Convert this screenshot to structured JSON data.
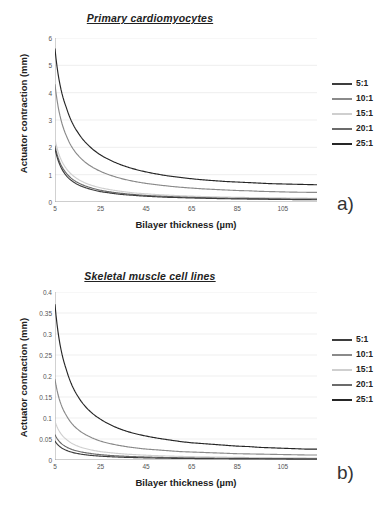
{
  "figure": {
    "panels": [
      {
        "key": "a",
        "panel_label": "a)",
        "title": "Primary cardiomyocytes",
        "xlabel": "Bilayer thickness  (µm)",
        "ylabel": "Actuator contraction  (mm)"
      },
      {
        "key": "b",
        "panel_label": "b)",
        "title": "Skeletal muscle cell lines",
        "xlabel": "Bilayer thickness  (µm)",
        "ylabel": "Actuator contraction  (mm)"
      }
    ],
    "legend": {
      "entries": [
        {
          "label": "5:1",
          "color": "#3d3d3d"
        },
        {
          "label": "10:1",
          "color": "#8a8a8a"
        },
        {
          "label": "15:1",
          "color": "#cfcfcf"
        },
        {
          "label": "20:1",
          "color": "#6b6b6b"
        },
        {
          "label": "25:1",
          "color": "#262626"
        }
      ]
    }
  },
  "chart_data": [
    {
      "type": "line",
      "panel": "a",
      "title": "Primary cardiomyocytes",
      "xlabel": "Bilayer thickness  (µm)",
      "ylabel": "Actuator contraction  (mm)",
      "xlim": [
        5,
        120
      ],
      "ylim": [
        0,
        6
      ],
      "xticks": [
        5,
        25,
        45,
        65,
        85,
        105
      ],
      "yticks": [
        0,
        1,
        2,
        3,
        4,
        5,
        6
      ],
      "xticklabels": [
        "5",
        "25",
        "45",
        "65",
        "85",
        "105"
      ],
      "yticklabels": [
        "0",
        "1",
        "2",
        "3",
        "4",
        "5",
        "6"
      ],
      "grid": "horizontal",
      "legend_position": "right-outside",
      "x": [
        5,
        10,
        15,
        20,
        25,
        30,
        35,
        40,
        45,
        50,
        55,
        60,
        65,
        70,
        75,
        80,
        85,
        90,
        95,
        100,
        105,
        110,
        115,
        120
      ],
      "series": [
        {
          "name": "25:1",
          "color": "#262626",
          "values": [
            5.6,
            3.45,
            2.55,
            2.05,
            1.72,
            1.5,
            1.33,
            1.2,
            1.1,
            1.02,
            0.95,
            0.9,
            0.85,
            0.81,
            0.78,
            0.75,
            0.73,
            0.71,
            0.69,
            0.67,
            0.66,
            0.65,
            0.64,
            0.63
          ]
        },
        {
          "name": "10:1",
          "color": "#8a8a8a",
          "values": [
            4.3,
            2.42,
            1.72,
            1.35,
            1.12,
            0.96,
            0.84,
            0.75,
            0.68,
            0.63,
            0.58,
            0.54,
            0.51,
            0.48,
            0.46,
            0.44,
            0.42,
            0.41,
            0.39,
            0.38,
            0.37,
            0.36,
            0.355,
            0.35
          ]
        },
        {
          "name": "15:1",
          "color": "#cfcfcf",
          "values": [
            2.3,
            1.22,
            0.84,
            0.64,
            0.52,
            0.44,
            0.38,
            0.33,
            0.3,
            0.27,
            0.25,
            0.23,
            0.215,
            0.2,
            0.19,
            0.18,
            0.17,
            0.165,
            0.16,
            0.155,
            0.15,
            0.145,
            0.14,
            0.135
          ]
        },
        {
          "name": "20:1",
          "color": "#6b6b6b",
          "values": [
            2.05,
            1.05,
            0.71,
            0.54,
            0.43,
            0.36,
            0.31,
            0.27,
            0.24,
            0.22,
            0.2,
            0.185,
            0.17,
            0.16,
            0.15,
            0.14,
            0.135,
            0.13,
            0.125,
            0.12,
            0.115,
            0.11,
            0.108,
            0.105
          ]
        },
        {
          "name": "5:1",
          "color": "#3d3d3d",
          "values": [
            1.95,
            0.96,
            0.64,
            0.48,
            0.38,
            0.32,
            0.27,
            0.24,
            0.21,
            0.19,
            0.17,
            0.16,
            0.147,
            0.137,
            0.128,
            0.12,
            0.113,
            0.107,
            0.102,
            0.097,
            0.093,
            0.089,
            0.086,
            0.083
          ]
        }
      ]
    },
    {
      "type": "line",
      "panel": "b",
      "title": "Skeletal muscle cell lines",
      "xlabel": "Bilayer thickness  (µm)",
      "ylabel": "Actuator contraction  (mm)",
      "xlim": [
        5,
        120
      ],
      "ylim": [
        0,
        0.4
      ],
      "xticks": [
        5,
        25,
        45,
        65,
        85,
        105
      ],
      "yticks": [
        0,
        0.05,
        0.1,
        0.15,
        0.2,
        0.25,
        0.3,
        0.35,
        0.4
      ],
      "xticklabels": [
        "5",
        "25",
        "45",
        "65",
        "85",
        "105"
      ],
      "yticklabels": [
        "0",
        "0.05",
        "0.1",
        "0.15",
        "0.2",
        "0.25",
        "0.3",
        "0.35",
        "0.4"
      ],
      "grid": "horizontal",
      "legend_position": "right-outside",
      "x": [
        5,
        10,
        15,
        20,
        25,
        30,
        35,
        40,
        45,
        50,
        55,
        60,
        65,
        70,
        75,
        80,
        85,
        90,
        95,
        100,
        105,
        110,
        115,
        120
      ],
      "series": [
        {
          "name": "25:1",
          "color": "#262626",
          "values": [
            0.37,
            0.215,
            0.152,
            0.118,
            0.097,
            0.082,
            0.071,
            0.063,
            0.057,
            0.052,
            0.048,
            0.044,
            0.041,
            0.039,
            0.037,
            0.035,
            0.033,
            0.032,
            0.03,
            0.029,
            0.028,
            0.027,
            0.026,
            0.026
          ]
        },
        {
          "name": "10:1",
          "color": "#8a8a8a",
          "values": [
            0.192,
            0.106,
            0.073,
            0.056,
            0.045,
            0.038,
            0.033,
            0.029,
            0.026,
            0.024,
            0.022,
            0.02,
            0.019,
            0.018,
            0.017,
            0.016,
            0.015,
            0.0145,
            0.014,
            0.0135,
            0.013,
            0.0125,
            0.012,
            0.012
          ]
        },
        {
          "name": "15:1",
          "color": "#cfcfcf",
          "values": [
            0.092,
            0.049,
            0.033,
            0.025,
            0.02,
            0.017,
            0.0145,
            0.0128,
            0.0114,
            0.0103,
            0.0094,
            0.0087,
            0.008,
            0.0075,
            0.0071,
            0.0067,
            0.0063,
            0.006,
            0.0058,
            0.0055,
            0.0053,
            0.0051,
            0.0049,
            0.0048
          ]
        },
        {
          "name": "20:1",
          "color": "#6b6b6b",
          "values": [
            0.06,
            0.031,
            0.021,
            0.016,
            0.0127,
            0.0106,
            0.0091,
            0.008,
            0.0071,
            0.0064,
            0.0058,
            0.0054,
            0.005,
            0.0046,
            0.0043,
            0.0041,
            0.0039,
            0.0037,
            0.0035,
            0.0034,
            0.0032,
            0.0031,
            0.003,
            0.0029
          ]
        },
        {
          "name": "5:1",
          "color": "#3d3d3d",
          "values": [
            0.045,
            0.023,
            0.0152,
            0.0114,
            0.0091,
            0.0076,
            0.0065,
            0.0057,
            0.0051,
            0.0045,
            0.0041,
            0.0038,
            0.0035,
            0.0033,
            0.0031,
            0.0029,
            0.0027,
            0.0026,
            0.0025,
            0.0024,
            0.0023,
            0.0022,
            0.0021,
            0.002
          ]
        }
      ]
    }
  ]
}
